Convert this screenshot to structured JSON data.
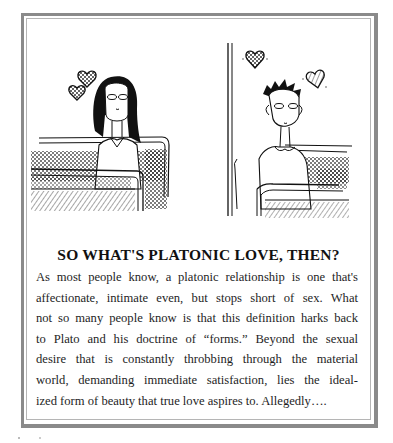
{
  "page": {
    "illustration": {
      "left_panel": {
        "description": "Girl with long dark hair sitting on a bus seat, eyes half-closed, two hearts floating above",
        "hearts": 2
      },
      "right_panel": {
        "description": "Boy with spiky hair sitting on a bus seat next to a vertical pole, eyes half-closed, two hearts floating above",
        "hearts": 2
      }
    },
    "sidebar_box": {
      "heading": "SO WHAT'S PLATONIC LOVE, THEN?",
      "body_lines": [
        "As most people know, a platonic relationship is one that's",
        "affectionate, intimate even, but stops short of sex. What",
        "not so many people know is that this definition harks back",
        "to Plato and his doctrine of “forms.” Beyond the sexual",
        "desire that is constantly throbbing through the material",
        "world, demanding immediate satisfaction, lies the ideal-",
        "ized form of beauty that true love aspires to. Allegedly…."
      ]
    },
    "colors": {
      "frame_outer": "#8a8a8a",
      "frame_inner": "#b5b5b5",
      "ink": "#1a1a1a",
      "paper": "#ffffff"
    }
  }
}
